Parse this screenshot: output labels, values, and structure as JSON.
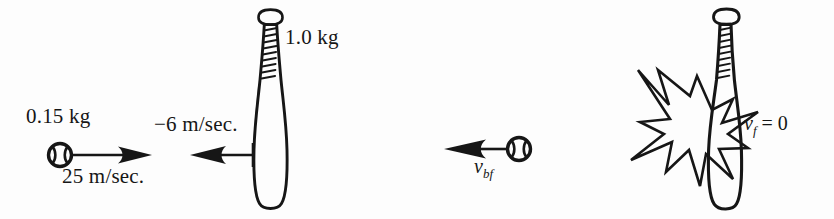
{
  "figure": {
    "background_color": "#fdfdfd",
    "ink_color": "#161616",
    "panels": [
      {
        "name": "before-collision",
        "objects": [
          {
            "name": "baseball",
            "icon": "baseball-icon",
            "mass_label": "0.15 kg",
            "velocity_label": "25 m/sec.",
            "velocity_direction": "right"
          },
          {
            "name": "baseball-bat",
            "icon": "baseball-bat-icon",
            "mass_label": "1.0 kg",
            "velocity_label": "−6 m/sec.",
            "velocity_direction": "left"
          }
        ]
      },
      {
        "name": "after-collision",
        "objects": [
          {
            "name": "baseball",
            "icon": "baseball-icon",
            "velocity_symbol": "v",
            "velocity_subscript": "bf",
            "velocity_direction": "left"
          },
          {
            "name": "baseball-bat",
            "icon": "baseball-bat-icon",
            "velocity_symbol": "v",
            "velocity_subscript": "f",
            "velocity_value": "= 0",
            "collision_icon": "starburst-icon"
          }
        ]
      }
    ],
    "labels": {
      "ball_mass_left": "0.15 kg",
      "ball_velocity_left": "25 m/sec.",
      "bat_velocity_left": "−6 m/sec.",
      "bat_mass_left": "1.0 kg",
      "ball_velocity_right_symbol": "v",
      "ball_velocity_right_sub": "bf",
      "bat_velocity_right_symbol": "v",
      "bat_velocity_right_sub": "f",
      "bat_velocity_right_value": "= 0"
    }
  }
}
